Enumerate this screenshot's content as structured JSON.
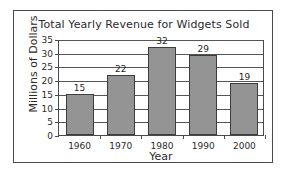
{
  "frame": {
    "border_color": "#4a4a4a",
    "background": "#ffffff"
  },
  "chart_data": {
    "type": "bar",
    "title": "Total Yearly Revenue for Widgets Sold",
    "xlabel": "Year",
    "ylabel": "Millions of Dollars",
    "categories": [
      "1960",
      "1970",
      "1980",
      "1990",
      "2000"
    ],
    "values": [
      15,
      22,
      32,
      29,
      19
    ],
    "value_labels": [
      "15",
      "22",
      "32",
      "29",
      "19"
    ],
    "ylim": [
      0,
      35
    ],
    "ytick_step": 5,
    "yticks": [
      0,
      5,
      10,
      15,
      20,
      25,
      30,
      35
    ],
    "ytick_labels": [
      "0",
      "5",
      "10",
      "15",
      "20",
      "25",
      "30",
      "35"
    ],
    "grid": "horizontal",
    "legend": "none",
    "bar_color": "#949494",
    "bar_edge_color": "#3d3d3d",
    "gridline_color": "#555555",
    "axis_color": "#4a4a4a",
    "text_color": "#2b2b2b"
  }
}
